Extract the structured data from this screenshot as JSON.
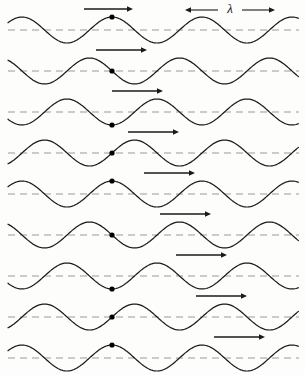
{
  "figure": {
    "background_color": "#fdfdfc",
    "width": 305,
    "height": 375
  },
  "wave": {
    "stroke_color": "#1a1a1a",
    "axis_color": "#9a9a9a",
    "dot_color": "#000000",
    "arrow_color": "#1a1a1a",
    "wavelength_px": 90,
    "amplitude_px": 13,
    "row_count": 9,
    "row_spacing_px": 41,
    "first_row_baseline_y": 30,
    "particle_x_px": 112,
    "dot_radius_px": 2.6,
    "left_edge_x": 8,
    "right_edge_x": 299
  },
  "lambda_marker": {
    "label": "λ",
    "label_x": 230,
    "label_y": 9,
    "line_y": 10,
    "start_x": 185,
    "end_x": 275,
    "gap_half_width": 12
  },
  "rows": [
    {
      "index": 0,
      "phase_label": "crest",
      "phase_turns": 0,
      "particle_offset_px": -13,
      "arrow": {
        "start_x": 84,
        "end_x": 133,
        "y": 9
      }
    },
    {
      "index": 1,
      "phase_label": "zero-descending",
      "phase_turns": 0.25,
      "particle_offset_px": 0,
      "arrow": {
        "start_x": 96,
        "end_x": 147,
        "y": 50
      }
    },
    {
      "index": 2,
      "phase_label": "trough",
      "phase_turns": 0.5,
      "particle_offset_px": 13,
      "arrow": {
        "start_x": 112,
        "end_x": 163,
        "y": 91
      }
    },
    {
      "index": 3,
      "phase_label": "zero-ascending",
      "phase_turns": 0.75,
      "particle_offset_px": 0,
      "arrow": {
        "start_x": 128,
        "end_x": 179,
        "y": 132
      }
    },
    {
      "index": 4,
      "phase_label": "crest",
      "phase_turns": 1.0,
      "particle_offset_px": -13,
      "arrow": {
        "start_x": 144,
        "end_x": 195,
        "y": 173
      }
    },
    {
      "index": 5,
      "phase_label": "zero-descending",
      "phase_turns": 1.25,
      "particle_offset_px": 0,
      "arrow": {
        "start_x": 160,
        "end_x": 211,
        "y": 214
      }
    },
    {
      "index": 6,
      "phase_label": "trough",
      "phase_turns": 1.5,
      "particle_offset_px": 13,
      "arrow": {
        "start_x": 176,
        "end_x": 227,
        "y": 255
      }
    },
    {
      "index": 7,
      "phase_label": "zero-ascending",
      "phase_turns": 1.75,
      "particle_offset_px": 0,
      "arrow": {
        "start_x": 196,
        "end_x": 247,
        "y": 296
      }
    },
    {
      "index": 8,
      "phase_label": "crest",
      "phase_turns": 2.0,
      "particle_offset_px": -13,
      "arrow": {
        "start_x": 214,
        "end_x": 265,
        "y": 337
      }
    }
  ]
}
